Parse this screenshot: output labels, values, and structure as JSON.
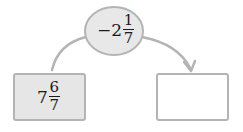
{
  "operator": {
    "sign": "−",
    "whole": "2",
    "numerator": "1",
    "denominator": "7",
    "display": "−2 1/7"
  },
  "input_box": {
    "whole": "7",
    "numerator": "6",
    "denominator": "7",
    "display": "7 6/7"
  },
  "output_box": {
    "value": ""
  },
  "colors": {
    "stroke": "#b4b4b4",
    "ellipse_fill": "#e8e8e8",
    "input_fill": "#e6e6e6",
    "output_fill": "#ffffff"
  }
}
